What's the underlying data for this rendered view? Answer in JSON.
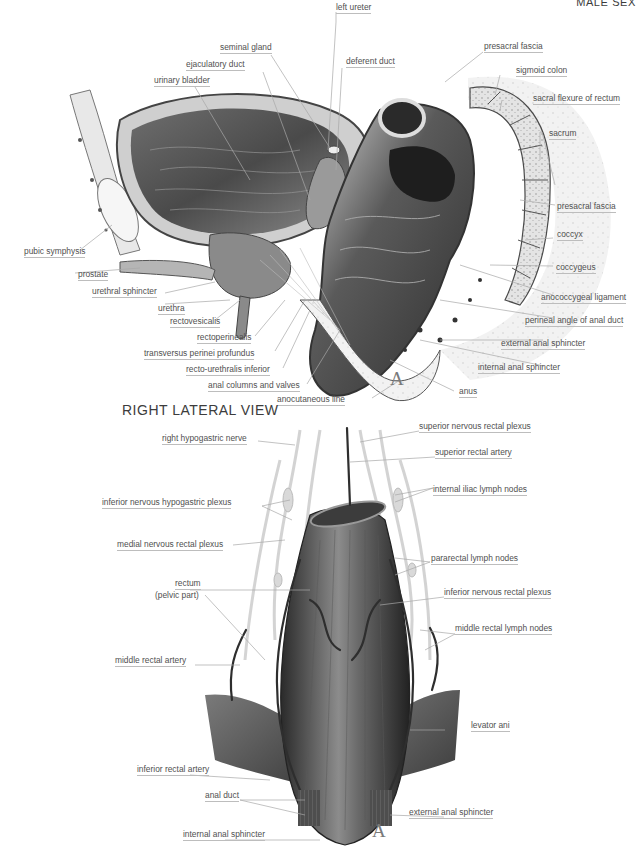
{
  "header": {
    "text": "MALE SEX"
  },
  "top_figure": {
    "marker": "A",
    "view_title": "RIGHT LATERAL VIEW",
    "labels": [
      {
        "id": "left-ureter",
        "text": "left ureter"
      },
      {
        "id": "seminal-gland",
        "text": "seminal gland"
      },
      {
        "id": "ejaculatory-duct",
        "text": "ejaculatory duct"
      },
      {
        "id": "deferent-duct",
        "text": "deferent duct"
      },
      {
        "id": "presacral-fascia-top",
        "text": "presacral fascia"
      },
      {
        "id": "urinary-bladder",
        "text": "urinary bladder"
      },
      {
        "id": "sigmoid-colon",
        "text": "sigmoid colon"
      },
      {
        "id": "sacral-flexure",
        "text": "sacral flexure of rectum"
      },
      {
        "id": "sacrum",
        "text": "sacrum"
      },
      {
        "id": "presacral-fascia",
        "text": "presacral fascia"
      },
      {
        "id": "pubic-symphysis",
        "text": "pubic symphysis"
      },
      {
        "id": "coccyx",
        "text": "coccyx"
      },
      {
        "id": "prostate",
        "text": "prostate"
      },
      {
        "id": "coccygeus",
        "text": "coccygeus"
      },
      {
        "id": "urethral-sphincter",
        "text": "urethral sphincter"
      },
      {
        "id": "urethra",
        "text": "urethra"
      },
      {
        "id": "anococcygeal-ligament",
        "text": "anococcygeal ligament"
      },
      {
        "id": "rectovesicalis",
        "text": "rectovesicalis"
      },
      {
        "id": "perineal-angle",
        "text": "perineal angle of anal duct"
      },
      {
        "id": "rectoperinealis",
        "text": "rectoperinealis"
      },
      {
        "id": "external-anal-sphincter-top",
        "text": "external anal sphincter"
      },
      {
        "id": "transversus-perinei",
        "text": "transversus perinei profundus"
      },
      {
        "id": "recto-urethralis",
        "text": "recto-urethralis inferior"
      },
      {
        "id": "internal-anal-sphincter-top",
        "text": "internal anal sphincter"
      },
      {
        "id": "anal-columns",
        "text": "anal columns and valves"
      },
      {
        "id": "anus",
        "text": "anus"
      },
      {
        "id": "anocutaneous-line",
        "text": "anocutaneous line"
      }
    ]
  },
  "bottom_figure": {
    "marker": "A",
    "labels": [
      {
        "id": "right-hypogastric-nerve",
        "text": "right hypogastric nerve"
      },
      {
        "id": "superior-nervous-rectal-plexus",
        "text": "superior nervous rectal plexus"
      },
      {
        "id": "superior-rectal-artery",
        "text": "superior rectal artery"
      },
      {
        "id": "internal-iliac-lymph-nodes",
        "text": "internal iliac lymph nodes"
      },
      {
        "id": "inferior-nervous-hypogastric-plexus",
        "text": "inferior nervous hypogastric plexus"
      },
      {
        "id": "medial-nervous-rectal-plexus",
        "text": "medial nervous rectal plexus"
      },
      {
        "id": "pararectal-lymph-nodes",
        "text": "pararectal lymph nodes"
      },
      {
        "id": "rectum",
        "text": "rectum"
      },
      {
        "id": "rectum-sub",
        "text": "(pelvic part)"
      },
      {
        "id": "inferior-nervous-rectal-plexus",
        "text": "inferior nervous rectal plexus"
      },
      {
        "id": "middle-rectal-lymph-nodes",
        "text": "middle rectal lymph nodes"
      },
      {
        "id": "middle-rectal-artery",
        "text": "middle rectal artery"
      },
      {
        "id": "levator-ani",
        "text": "levator ani"
      },
      {
        "id": "inferior-rectal-artery",
        "text": "inferior rectal artery"
      },
      {
        "id": "anal-duct",
        "text": "anal duct"
      },
      {
        "id": "external-anal-sphincter",
        "text": "external anal sphincter"
      },
      {
        "id": "internal-anal-sphincter",
        "text": "internal anal sphincter"
      }
    ]
  }
}
